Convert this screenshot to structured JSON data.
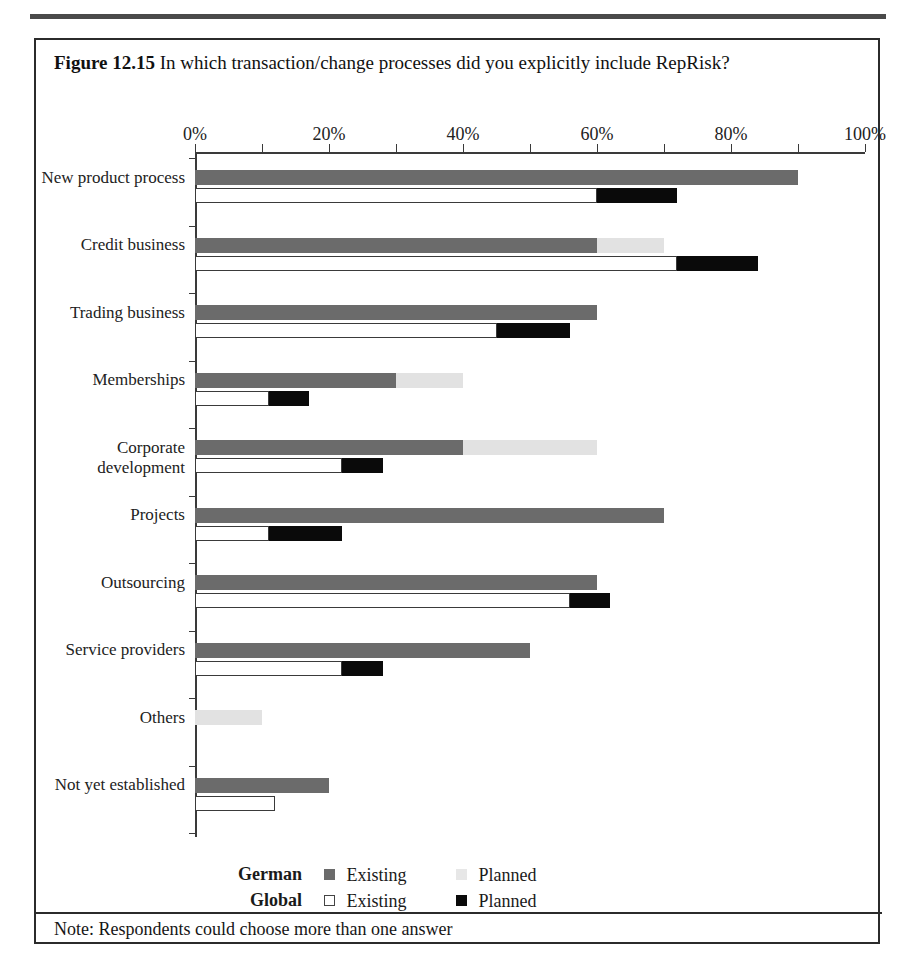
{
  "figure": {
    "number": "Figure 12.15",
    "caption": "In which transaction/change processes did you explicitly include RepRisk?",
    "note": "Note: Respondents could choose more than one answer"
  },
  "legend": {
    "rows": [
      {
        "group": "German",
        "items": [
          {
            "label": "Existing",
            "swatch": "dark-gray-square-icon",
            "color": "#6b6b6b"
          },
          {
            "label": "Planned",
            "swatch": "light-gray-square-icon",
            "color": "#e7e7e7"
          }
        ]
      },
      {
        "group": "Global",
        "items": [
          {
            "label": "Existing",
            "swatch": "white-square-icon",
            "color": "#ffffff"
          },
          {
            "label": "Planned",
            "swatch": "black-square-icon",
            "color": "#0a0a0a"
          }
        ]
      }
    ]
  },
  "chart_data": {
    "type": "bar",
    "orientation": "horizontal",
    "stacked": true,
    "title": "In which transaction/change processes did you explicitly include RepRisk?",
    "xlabel": "",
    "ylabel": "",
    "xlim": [
      0,
      100
    ],
    "xticks": [
      0,
      10,
      20,
      30,
      40,
      50,
      60,
      70,
      80,
      90,
      100
    ],
    "xticklabels": [
      "0%",
      "20%",
      "40%",
      "60%",
      "80%",
      "100%"
    ],
    "xticklabel_values": [
      0,
      20,
      40,
      60,
      80,
      100
    ],
    "grid": false,
    "legend_position": "bottom",
    "unit": "%",
    "categories": [
      "New product process",
      "Credit business",
      "Trading business",
      "Memberships",
      "Corporate development",
      "Projects",
      "Outsourcing",
      "Service providers",
      "Others",
      "Not yet established"
    ],
    "series": [
      {
        "name": "German Existing",
        "color": "#6b6b6b",
        "values": [
          90,
          60,
          60,
          30,
          40,
          70,
          60,
          50,
          0,
          20
        ]
      },
      {
        "name": "German Planned",
        "color": "#e7e7e7",
        "values": [
          0,
          10,
          0,
          10,
          20,
          0,
          0,
          0,
          10,
          0
        ]
      },
      {
        "name": "Global Existing",
        "color": "#ffffff",
        "values": [
          60,
          72,
          45,
          11,
          22,
          11,
          56,
          22,
          0,
          12
        ]
      },
      {
        "name": "Global Planned",
        "color": "#0a0a0a",
        "values": [
          12,
          12,
          11,
          6,
          6,
          11,
          6,
          6,
          0,
          0
        ]
      }
    ]
  }
}
